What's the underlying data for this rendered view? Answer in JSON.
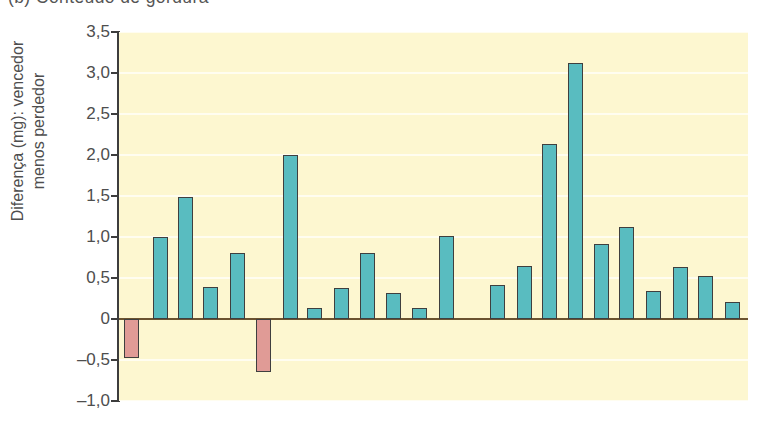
{
  "panel": {
    "title": "(b) Conteúdo de gordura"
  },
  "axes": {
    "y_title": "Diferença (mg): vencedor\nmenos perdedor",
    "y_ticks": [
      "3,5",
      "3,0",
      "2,5",
      "2,0",
      "1,5",
      "1,0",
      "0,5",
      "0",
      "–0,5",
      "–1,0"
    ],
    "y_tick_values": [
      3.5,
      3.0,
      2.5,
      2.0,
      1.5,
      1.0,
      0.5,
      0,
      -0.5,
      -1.0
    ],
    "x_ticks": []
  },
  "colors": {
    "plot_background": "#fdf7d0",
    "gridline": "#fffdf0",
    "positive_bar": "#59bcc0",
    "negative_bar": "#e09b96",
    "bar_outline": "#3f3f3f",
    "zero_line": "#6b5330",
    "axis": "#3d3d3d",
    "text": "#4e4e4e"
  },
  "chart_data": {
    "type": "bar",
    "title": "(b) Conteúdo de gordura",
    "xlabel": "",
    "ylabel": "Diferença (mg): vencedor menos perdedor",
    "ylim": [
      -1.0,
      3.5
    ],
    "ytick_step": 0.5,
    "grid": true,
    "legend": "none",
    "categories": [
      "1",
      "2",
      "3",
      "4",
      "5",
      "6",
      "7",
      "8",
      "9",
      "10",
      "11",
      "12",
      "13",
      "14",
      "15",
      "16",
      "17",
      "18",
      "19",
      "20",
      "21",
      "22",
      "23"
    ],
    "values": [
      -0.47,
      1.0,
      1.49,
      0.39,
      0.81,
      -0.65,
      2.0,
      0.13,
      0.38,
      0.81,
      0.32,
      0.14,
      1.01,
      0.41,
      0.65,
      2.13,
      3.12,
      0.92,
      1.12,
      0.34,
      0.63,
      0.52,
      0.21
    ],
    "bar_left_fraction": [
      0.0079,
      0.054,
      0.0938,
      0.1335,
      0.1764,
      0.2178,
      0.2607,
      0.2989,
      0.3418,
      0.3831,
      0.4245,
      0.4658,
      0.5087,
      0.5898,
      0.6327,
      0.6725,
      0.7138,
      0.7552,
      0.7949,
      0.8378,
      0.8807,
      0.9205,
      0.9634
    ],
    "bar_width_fraction": 0.0238
  }
}
